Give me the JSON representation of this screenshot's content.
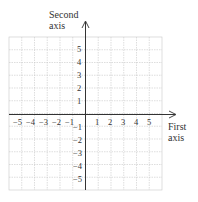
{
  "diagram": {
    "type": "coordinate-plane",
    "y_axis_label": [
      "Second",
      "axis"
    ],
    "x_axis_label": [
      "First",
      "axis"
    ],
    "x_ticks_negative": [
      "−5",
      "−4",
      "−3",
      "−2",
      "−1"
    ],
    "x_ticks_positive": [
      "1",
      "2",
      "3",
      "4",
      "5"
    ],
    "y_ticks_positive": [
      "5",
      "4",
      "3",
      "2",
      "1"
    ],
    "y_ticks_negative": [
      "−1",
      "−2",
      "−3",
      "−4",
      "−5"
    ],
    "grid": {
      "cells_x": 12,
      "cells_y": 12,
      "range": [
        -6,
        6
      ]
    },
    "colors": {
      "grid": "#c8c8c8",
      "axis": "#333333"
    }
  }
}
